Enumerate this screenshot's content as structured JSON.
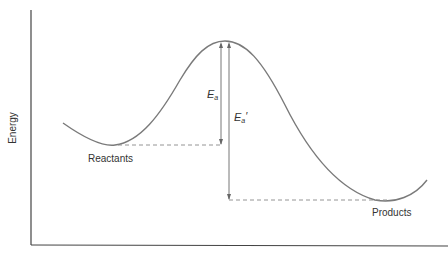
{
  "diagram": {
    "type": "reaction-energy-profile",
    "y_axis_label": "Energy",
    "x_axis_label": "",
    "labels": {
      "reactants": "Reactants",
      "products": "Products",
      "ea_main": "E",
      "ea_sub": "a",
      "ea_prime_main": "E",
      "ea_prime_sub": "a",
      "ea_prime_mark": "′"
    },
    "colors": {
      "curve": "#7a7a7a",
      "axis": "#444444",
      "dashed": "#888888",
      "text": "#333333"
    },
    "key_points": {
      "reactants_min": [
        113,
        145
      ],
      "transition_state_peak": [
        225,
        41
      ],
      "products_min": [
        390,
        200
      ]
    }
  }
}
